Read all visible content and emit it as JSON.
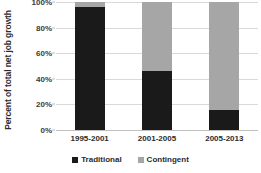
{
  "chart_data": {
    "type": "bar",
    "subtype": "stacked-100-percent",
    "title": "",
    "xlabel": "",
    "ylabel": "Percent of total net job growth",
    "categories": [
      "1995-2001",
      "2001-2005",
      "2005-2013"
    ],
    "series": [
      {
        "name": "Traditional",
        "color": "#1a1a1a",
        "values": [
          96,
          46,
          16
        ]
      },
      {
        "name": "Contingent",
        "color": "#a6a6a6",
        "values": [
          4,
          54,
          84
        ]
      }
    ],
    "ylim": [
      0,
      100
    ],
    "yticks": [
      0,
      20,
      40,
      60,
      80,
      100
    ],
    "ytick_labels": [
      "0%",
      "20%",
      "40%",
      "60%",
      "80%",
      "100%"
    ],
    "grid": true,
    "legend_position": "bottom"
  },
  "axis": {
    "y_title": "Percent of total net job growth"
  },
  "legend": {
    "entries": [
      {
        "label": "Traditional",
        "color": "#1a1a1a"
      },
      {
        "label": "Contingent",
        "color": "#a6a6a6"
      }
    ]
  },
  "colors": {
    "traditional": "#1a1a1a",
    "contingent": "#a6a6a6",
    "gridline": "#d9d9d9",
    "axis": "#bfbfbf",
    "text": "#2b2b2b",
    "background": "#ffffff"
  }
}
